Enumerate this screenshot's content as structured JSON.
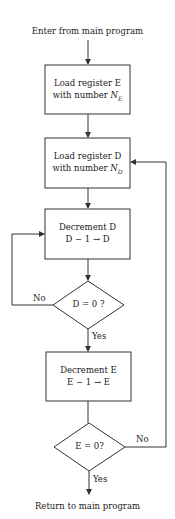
{
  "flowchart": {
    "start": "Enter from main program",
    "end": "Return to main program",
    "nodes": [
      {
        "id": "load_e",
        "type": "process",
        "line1": "Load register E",
        "line2_prefix": "with number ",
        "var": "N",
        "sub": "E"
      },
      {
        "id": "load_d",
        "type": "process",
        "line1": "Load register D",
        "line2_prefix": "with number ",
        "var": "N",
        "sub": "D"
      },
      {
        "id": "dec_d",
        "type": "process",
        "line1": "Decrement D",
        "line2": "D − 1 → D"
      },
      {
        "id": "test_d",
        "type": "decision",
        "label": "D = 0 ?",
        "no": "No",
        "yes": "Yes"
      },
      {
        "id": "dec_e",
        "type": "process",
        "line1": "Decrement E",
        "line2": "E − 1 → E"
      },
      {
        "id": "test_e",
        "type": "decision",
        "label": "E = 0?",
        "no": "No",
        "yes": "Yes"
      }
    ],
    "colors": {
      "line": "#333333",
      "background": "#ffffff"
    }
  }
}
